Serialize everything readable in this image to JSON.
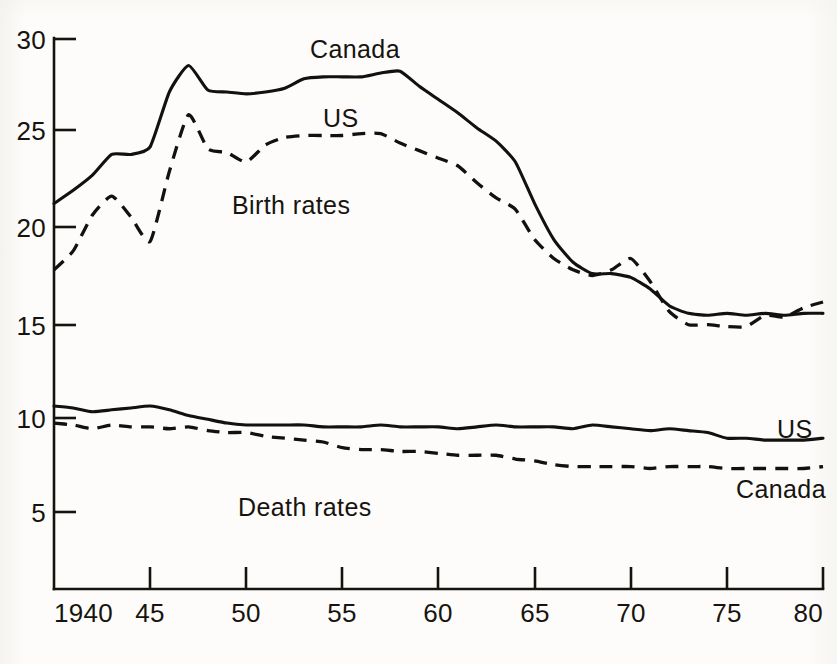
{
  "chart_data": {
    "type": "line",
    "title": "",
    "subtitle": "",
    "xlabel": "",
    "ylabel": "",
    "xlim": [
      1940,
      1980
    ],
    "ylim": [
      0,
      30
    ],
    "grid": false,
    "legend_position": "inline-annotations",
    "x_tick_labels": [
      "1940",
      "45",
      "50",
      "55",
      "60",
      "65",
      "70",
      "75",
      "80"
    ],
    "x_tick_values": [
      1940,
      1945,
      1950,
      1955,
      1960,
      1965,
      1970,
      1975,
      1980
    ],
    "y_tick_labels": [
      "5",
      "10",
      "15",
      "20",
      "25",
      "30"
    ],
    "y_tick_values": [
      5,
      10,
      15,
      20,
      25,
      30
    ],
    "annotations": [
      {
        "text": "Canada",
        "x": 1954.5,
        "y": 29.4,
        "series": "canada-birth"
      },
      {
        "text": "US",
        "x": 1956.0,
        "y": 25.9,
        "series": "us-birth"
      },
      {
        "text": "Birth rates",
        "x": 1950.5,
        "y": 21.5,
        "series": "group-label"
      },
      {
        "text": "Death rates",
        "x": 1950.0,
        "y": 5.9,
        "series": "group-label"
      },
      {
        "text": "US",
        "x": 1978.0,
        "y": 9.8,
        "series": "us-death"
      },
      {
        "text": "Canada",
        "x": 1976.5,
        "y": 6.6,
        "series": "canada-death"
      }
    ],
    "x": [
      1940,
      1941,
      1942,
      1943,
      1944,
      1945,
      1946,
      1947,
      1948,
      1949,
      1950,
      1951,
      1952,
      1953,
      1954,
      1955,
      1956,
      1957,
      1958,
      1959,
      1960,
      1961,
      1962,
      1963,
      1964,
      1965,
      1966,
      1967,
      1968,
      1969,
      1970,
      1971,
      1972,
      1973,
      1974,
      1975,
      1976,
      1977,
      1978,
      1979,
      1980
    ],
    "series": [
      {
        "name": "Canada birth rate",
        "style": "solid",
        "values": [
          21.3,
          22.0,
          22.8,
          23.9,
          23.9,
          24.3,
          27.2,
          28.6,
          27.3,
          27.2,
          27.1,
          27.2,
          27.4,
          27.9,
          28.0,
          28.0,
          28.0,
          28.2,
          28.3,
          27.5,
          26.8,
          26.1,
          25.3,
          24.6,
          23.5,
          21.3,
          19.4,
          18.2,
          17.6,
          17.6,
          17.4,
          16.8,
          15.9,
          15.5,
          15.4,
          15.5,
          15.4,
          15.5,
          15.4,
          15.5,
          15.5
        ]
      },
      {
        "name": "US birth rate",
        "style": "dashed",
        "values": [
          17.8,
          18.8,
          20.7,
          21.7,
          20.6,
          19.3,
          23.0,
          26.0,
          24.2,
          24.0,
          23.5,
          24.4,
          24.8,
          24.9,
          24.9,
          24.9,
          25.0,
          25.0,
          24.5,
          24.1,
          23.7,
          23.3,
          22.4,
          21.6,
          21.0,
          19.4,
          18.4,
          17.8,
          17.5,
          17.8,
          18.4,
          17.2,
          15.6,
          14.9,
          14.9,
          14.8,
          14.8,
          15.4,
          15.3,
          15.8,
          16.1
        ]
      },
      {
        "name": "US death rate",
        "style": "solid",
        "values": [
          10.6,
          10.5,
          10.3,
          10.4,
          10.5,
          10.6,
          10.4,
          10.1,
          9.9,
          9.7,
          9.6,
          9.6,
          9.6,
          9.6,
          9.5,
          9.5,
          9.5,
          9.6,
          9.5,
          9.5,
          9.5,
          9.4,
          9.5,
          9.6,
          9.5,
          9.5,
          9.5,
          9.4,
          9.6,
          9.5,
          9.4,
          9.3,
          9.4,
          9.3,
          9.2,
          8.9,
          8.9,
          8.8,
          8.8,
          8.8,
          8.9
        ]
      },
      {
        "name": "Canada death rate",
        "style": "dashed",
        "values": [
          9.7,
          9.6,
          9.4,
          9.6,
          9.5,
          9.5,
          9.4,
          9.5,
          9.3,
          9.2,
          9.2,
          9.0,
          8.9,
          8.8,
          8.7,
          8.4,
          8.3,
          8.3,
          8.2,
          8.2,
          8.1,
          8.0,
          8.0,
          8.0,
          7.8,
          7.7,
          7.5,
          7.4,
          7.4,
          7.4,
          7.4,
          7.3,
          7.4,
          7.4,
          7.4,
          7.3,
          7.3,
          7.3,
          7.3,
          7.3,
          7.4
        ]
      }
    ]
  },
  "axis": {
    "x_labels": [
      "1940",
      "45",
      "50",
      "55",
      "60",
      "65",
      "70",
      "75",
      "80"
    ],
    "y_labels": [
      "30",
      "25",
      "20",
      "15",
      "10",
      "5"
    ]
  },
  "labels": {
    "canada_birth": "Canada",
    "us_birth": "US",
    "birth_rates": "Birth rates",
    "death_rates": "Death rates",
    "us_death": "US",
    "canada_death": "Canada"
  },
  "colors": {
    "ink": "#111111",
    "paper": "#fdfcfa"
  }
}
